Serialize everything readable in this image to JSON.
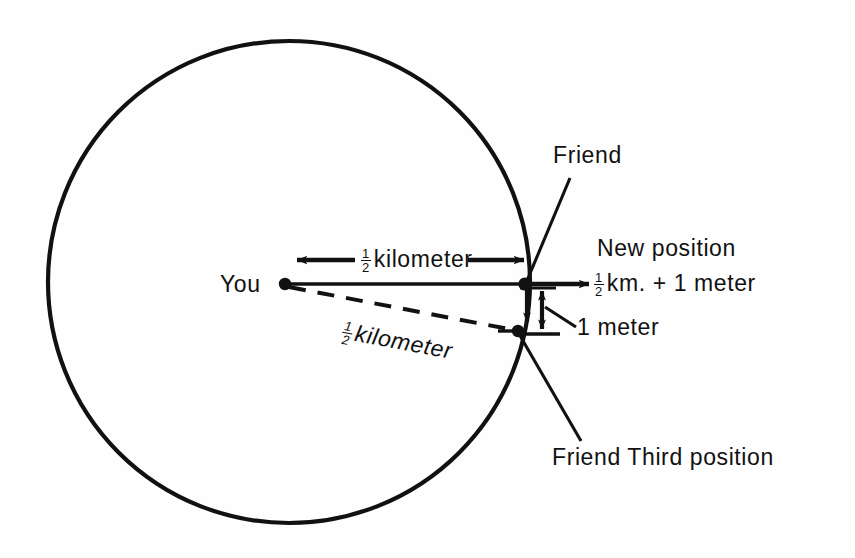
{
  "figure": {
    "background_color": "#fefefe",
    "stroke_color": "#111111"
  },
  "circle": {
    "center_x": 289,
    "center_y": 282,
    "radius": 241,
    "stroke_width": 4.2
  },
  "points": {
    "you": {
      "x": 285,
      "y": 284,
      "label": "You"
    },
    "friend": {
      "x": 524,
      "y": 284,
      "label": "Friend"
    },
    "third_position": {
      "x": 518,
      "y": 331,
      "label": "Friend  Third position"
    }
  },
  "labels": {
    "you": "You",
    "friend": "Friend",
    "radius_top_numerator": "1",
    "radius_top_denominator": "2",
    "radius_top_unit": "kilometer",
    "radius_dashed_numerator": "1",
    "radius_dashed_denominator": "2",
    "radius_dashed_unit": "kilometer",
    "new_position": "New position",
    "new_position_value_numerator": "1",
    "new_position_value_denominator": "2",
    "new_position_value_rest": "km. + 1 meter",
    "one_meter": "1 meter",
    "third_position": "Friend  Third position"
  },
  "measurements": {
    "radius_solid": "1/2 kilometer",
    "radius_dashed": "1/2 kilometer",
    "horizontal_offset": "1/2 km. + 1 meter",
    "vertical_gap": "1 meter"
  },
  "annotations": {
    "dimension_arrow_left_x": 295,
    "dimension_arrow_right_x": 525,
    "dimension_arrow_y": 260,
    "new_position_arrow_from_x": 530,
    "new_position_arrow_to_x": 590,
    "new_position_arrow_y": 284,
    "gap_arrow_top_y": 288,
    "gap_arrow_bottom_y": 333,
    "gap_arrow_x": 541
  }
}
